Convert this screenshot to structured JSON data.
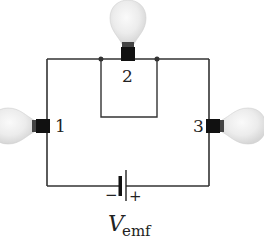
{
  "diagram": {
    "type": "circuit",
    "bulbs": [
      {
        "id": "1",
        "label": "1",
        "position": "left branch"
      },
      {
        "id": "2",
        "label": "2",
        "position": "top branch"
      },
      {
        "id": "3",
        "label": "3",
        "position": "right branch"
      }
    ],
    "battery": {
      "label_main": "V",
      "label_sub": "emf",
      "negative_sign": "−",
      "positive_sign": "+"
    },
    "colors": {
      "wire": "#333333",
      "socket": "#111111",
      "bulb_glass": "#e6e6e6"
    }
  }
}
